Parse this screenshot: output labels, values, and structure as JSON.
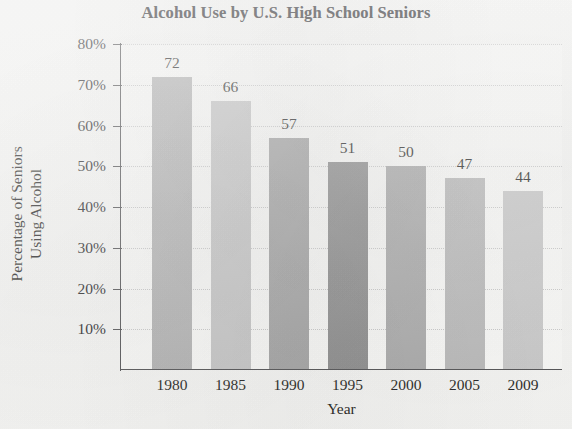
{
  "chart_data": {
    "type": "bar",
    "title": "Alcohol Use by U.S. High School Seniors",
    "xlabel": "Year",
    "ylabel_line1": "Percentage of Seniors",
    "ylabel_line2": "Using Alcohol",
    "categories": [
      "1980",
      "1985",
      "1990",
      "1995",
      "2000",
      "2005",
      "2009"
    ],
    "values": [
      72,
      66,
      57,
      51,
      50,
      47,
      44
    ],
    "value_labels": [
      "72",
      "66",
      "57",
      "51",
      "50",
      "47",
      "44"
    ],
    "bar_colors": [
      "#b2b2b2",
      "#c6c6c6",
      "#a2a2a2",
      "#8b8b8b",
      "#a9a9a9",
      "#b9b9b9",
      "#c9c9c9"
    ],
    "ylim": [
      0,
      80
    ],
    "ytick_values": [
      80,
      70,
      60,
      50,
      40,
      30,
      20,
      10
    ],
    "ytick_labels": [
      "80%",
      "70%",
      "60%",
      "50%",
      "40%",
      "30%",
      "20%",
      "10%"
    ],
    "grid": true,
    "grid_color": "#c9c9c9",
    "legend": "none",
    "axis_color": "#4d4d4f",
    "plot_background": "#fbfbf9",
    "page_background": "#f7f7f5",
    "units": "percent"
  }
}
